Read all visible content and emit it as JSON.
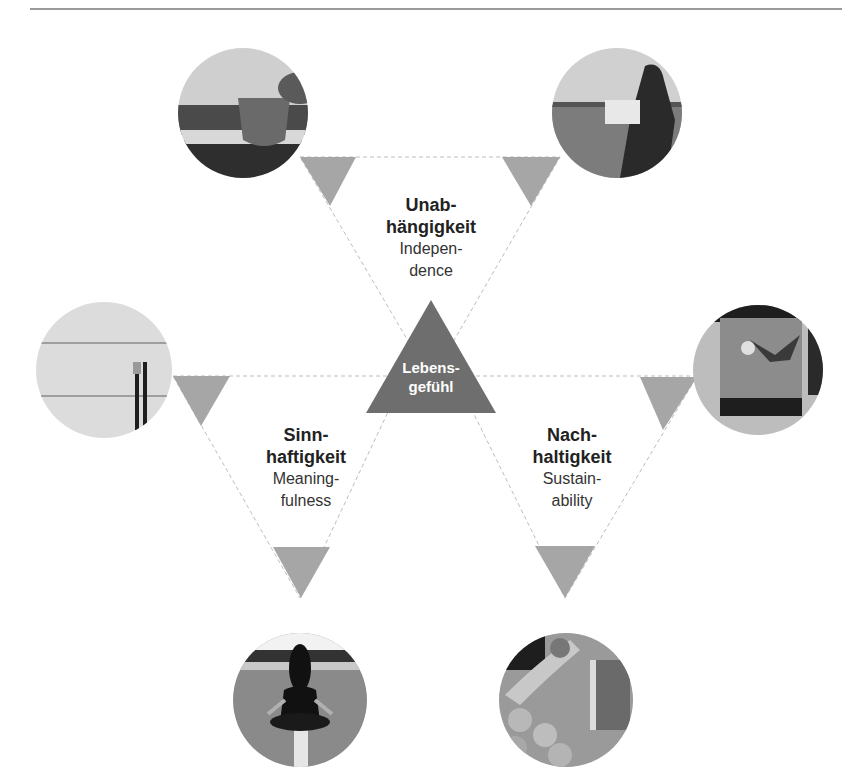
{
  "diagram": {
    "type": "star-of-triangles",
    "center": {
      "label_line1": "Lebens-",
      "label_line2": "gefühl"
    },
    "segments": [
      {
        "id": "independence",
        "title_line1": "Unab-",
        "title_line2": "hängigkeit",
        "subtitle_line1": "Indepen-",
        "subtitle_line2": "dence",
        "position": "top"
      },
      {
        "id": "meaningfulness",
        "title_line1": "Sinn-",
        "title_line2": "haftigkeit",
        "subtitle_line1": "Meaning-",
        "subtitle_line2": "fulness",
        "position": "bottom-left"
      },
      {
        "id": "sustainability",
        "title_line1": "Nach-",
        "title_line2": "haltigkeit",
        "subtitle_line1": "Sustain-",
        "subtitle_line2": "ability",
        "position": "bottom-right"
      }
    ],
    "photos": [
      {
        "id": "coffee-cup",
        "position": "top-left"
      },
      {
        "id": "person-by-sea",
        "position": "top-right"
      },
      {
        "id": "cutlery-on-table",
        "position": "left"
      },
      {
        "id": "gift-box",
        "position": "right"
      },
      {
        "id": "meditation-on-road",
        "position": "bottom-left"
      },
      {
        "id": "hands-with-fruit",
        "position": "bottom-right"
      }
    ],
    "colors": {
      "center_triangle": "#6e6e6e",
      "pointer_triangles": "#a6a6a6",
      "dashed_line": "#bdbdbd",
      "rule": "#9a9a9a"
    }
  }
}
